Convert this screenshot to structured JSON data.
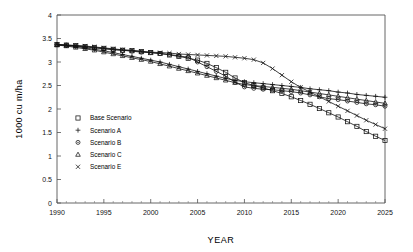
{
  "chart_data": {
    "type": "line",
    "title": "",
    "xlabel": "YEAR",
    "ylabel": "1000 cu m/ha",
    "xlim": [
      1990,
      2025
    ],
    "ylim": [
      0,
      4
    ],
    "ytick_step": 0.5,
    "xtick_step": 5,
    "x_minor_step": 1,
    "grid": false,
    "legend_position": "inside-left",
    "yticklabels": [
      "0",
      "0.5",
      "1",
      "1.5",
      "2",
      "2.5",
      "3",
      "3.5",
      "4"
    ],
    "xticklabels": [
      "1990",
      "1995",
      "2000",
      "2005",
      "2010",
      "2015",
      "2020",
      "2025"
    ],
    "x": [
      1990,
      1991,
      1992,
      1993,
      1994,
      1995,
      1996,
      1997,
      1998,
      1999,
      2000,
      2001,
      2002,
      2003,
      2004,
      2005,
      2006,
      2007,
      2008,
      2009,
      2010,
      2011,
      2012,
      2013,
      2014,
      2015,
      2016,
      2017,
      2018,
      2019,
      2020,
      2021,
      2022,
      2023,
      2024,
      2025
    ],
    "series": [
      {
        "name": "Base Scenario",
        "marker": "square",
        "values": [
          3.37,
          3.36,
          3.35,
          3.33,
          3.31,
          3.29,
          3.27,
          3.25,
          3.24,
          3.22,
          3.2,
          3.18,
          3.15,
          3.12,
          3.08,
          3.04,
          2.97,
          2.88,
          2.78,
          2.66,
          2.56,
          2.5,
          2.45,
          2.39,
          2.33,
          2.26,
          2.18,
          2.1,
          2.01,
          1.92,
          1.83,
          1.73,
          1.63,
          1.52,
          1.42,
          1.33
        ]
      },
      {
        "name": "Scenario A",
        "marker": "plus",
        "values": [
          3.37,
          3.35,
          3.33,
          3.3,
          3.27,
          3.24,
          3.2,
          3.16,
          3.12,
          3.08,
          3.04,
          3.0,
          2.95,
          2.9,
          2.85,
          2.8,
          2.75,
          2.7,
          2.65,
          2.61,
          2.58,
          2.56,
          2.54,
          2.52,
          2.5,
          2.48,
          2.46,
          2.43,
          2.41,
          2.39,
          2.36,
          2.34,
          2.31,
          2.29,
          2.27,
          2.25
        ]
      },
      {
        "name": "Scenario B",
        "marker": "circle",
        "values": [
          3.37,
          3.36,
          3.34,
          3.32,
          3.3,
          3.28,
          3.26,
          3.25,
          3.23,
          3.21,
          3.2,
          3.18,
          3.16,
          3.13,
          3.1,
          3.0,
          2.9,
          2.8,
          2.7,
          2.57,
          2.47,
          2.44,
          2.42,
          2.41,
          2.39,
          2.37,
          2.34,
          2.3,
          2.26,
          2.22,
          2.2,
          2.17,
          2.14,
          2.11,
          2.09,
          2.06
        ]
      },
      {
        "name": "Scenario C",
        "marker": "triangle",
        "values": [
          3.36,
          3.34,
          3.31,
          3.28,
          3.25,
          3.21,
          3.17,
          3.13,
          3.09,
          3.05,
          3.01,
          2.96,
          2.91,
          2.86,
          2.81,
          2.76,
          2.71,
          2.66,
          2.61,
          2.56,
          2.52,
          2.5,
          2.48,
          2.46,
          2.44,
          2.42,
          2.39,
          2.36,
          2.33,
          2.3,
          2.27,
          2.24,
          2.21,
          2.18,
          2.15,
          2.12
        ]
      },
      {
        "name": "Scenario E",
        "marker": "cross",
        "values": [
          3.37,
          3.36,
          3.35,
          3.34,
          3.32,
          3.3,
          3.28,
          3.26,
          3.25,
          3.23,
          3.21,
          3.2,
          3.19,
          3.17,
          3.16,
          3.15,
          3.14,
          3.13,
          3.12,
          3.1,
          3.08,
          3.05,
          2.98,
          2.86,
          2.72,
          2.58,
          2.46,
          2.36,
          2.26,
          2.16,
          2.06,
          1.96,
          1.86,
          1.76,
          1.67,
          1.58
        ]
      }
    ]
  },
  "legend": {
    "items": [
      {
        "label": "Base Scenario",
        "marker": "square"
      },
      {
        "label": "Scenario A",
        "marker": "plus"
      },
      {
        "label": "Scenario B",
        "marker": "circle"
      },
      {
        "label": "Scenario C",
        "marker": "triangle"
      },
      {
        "label": "Scenario E",
        "marker": "cross"
      }
    ]
  }
}
